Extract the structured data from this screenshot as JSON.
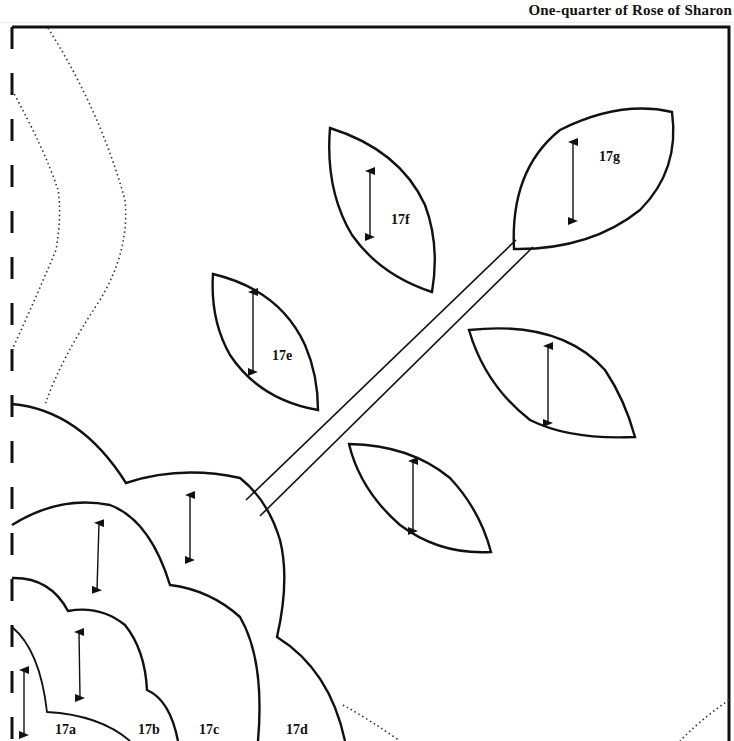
{
  "page": {
    "title": "One-quarter of Rose of Sharon"
  },
  "pattern": {
    "stroke_color": "#111111",
    "background": "#ffffff",
    "pieces": [
      {
        "id": "17a",
        "label": "17a"
      },
      {
        "id": "17b",
        "label": "17b"
      },
      {
        "id": "17c",
        "label": "17c"
      },
      {
        "id": "17d",
        "label": "17d"
      },
      {
        "id": "17e",
        "label": "17e"
      },
      {
        "id": "17f",
        "label": "17f"
      },
      {
        "id": "17g",
        "label": "17g"
      }
    ],
    "icons": {
      "grain_arrow": "double-headed-vertical-arrow"
    }
  }
}
